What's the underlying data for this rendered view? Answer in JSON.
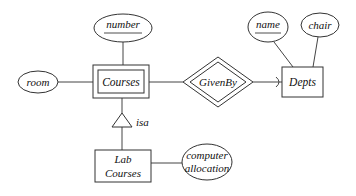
{
  "diagram": {
    "type": "er-diagram",
    "entities": [
      {
        "id": "courses",
        "label": "Courses",
        "weak": true
      },
      {
        "id": "depts",
        "label": "Depts",
        "weak": false
      },
      {
        "id": "lab_courses",
        "label_line1": "Lab",
        "label_line2": "Courses",
        "weak": false
      }
    ],
    "relationships": [
      {
        "id": "givenby",
        "label": "GivenBy",
        "identifying": true
      }
    ],
    "attributes": [
      {
        "id": "number",
        "label": "number",
        "key": true,
        "of": "courses"
      },
      {
        "id": "room",
        "label": "room",
        "key": false,
        "of": "courses"
      },
      {
        "id": "name",
        "label": "name",
        "key": true,
        "of": "depts"
      },
      {
        "id": "chair",
        "label": "chair",
        "key": false,
        "of": "depts"
      },
      {
        "id": "computer_allocation",
        "label_line1": "computer",
        "label_line2": "allocation",
        "key": false,
        "of": "lab_courses"
      }
    ],
    "isa": {
      "label": "isa",
      "parent": "courses",
      "child": "lab_courses"
    },
    "edges": [
      {
        "from": "number",
        "to": "courses"
      },
      {
        "from": "room",
        "to": "courses"
      },
      {
        "from": "courses",
        "to": "givenby"
      },
      {
        "from": "givenby",
        "to": "depts",
        "arrow": true
      },
      {
        "from": "name",
        "to": "depts"
      },
      {
        "from": "chair",
        "to": "depts"
      },
      {
        "from": "courses",
        "to": "isa"
      },
      {
        "from": "isa",
        "to": "lab_courses"
      },
      {
        "from": "lab_courses",
        "to": "computer_allocation"
      }
    ]
  }
}
